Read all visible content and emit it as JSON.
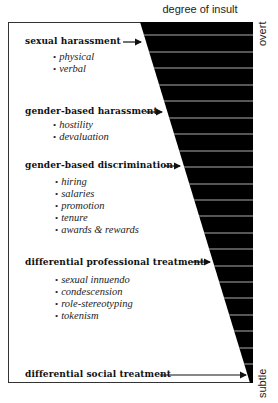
{
  "diagram": {
    "title": "degree of insult",
    "scale": {
      "top_label": "overt",
      "bottom_label": "subtle"
    },
    "colors": {
      "wedge": "#000000",
      "stripe": "#d8d8d8",
      "frame": "#333333",
      "arrow": "#111111"
    },
    "categories": [
      {
        "label": "sexual harassment",
        "items": [
          "physical",
          "verbal"
        ]
      },
      {
        "label": "gender-based harassment",
        "items": [
          "hostility",
          "devaluation"
        ]
      },
      {
        "label": "gender-based discrimination",
        "items": [
          "hiring",
          "salaries",
          "promotion",
          "tenure",
          "awards & rewards"
        ]
      },
      {
        "label": "differential professional treatment",
        "items": [
          "sexual innuendo",
          "condescension",
          "role-stereotyping",
          "tokenism"
        ]
      },
      {
        "label": "differential social treatment",
        "items": []
      }
    ]
  }
}
